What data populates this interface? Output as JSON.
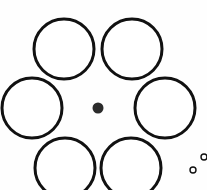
{
  "figure": {
    "name": "Ebbinghaus illusion",
    "alt_name": "Titchener circles",
    "width": 207,
    "height": 190,
    "background_color": "#fefefe",
    "stroke_color": "#111111",
    "fill_color": "#ffffff",
    "dot_color": "#2b2b2b"
  },
  "chart_data": {
    "type": "scatter",
    "title": "",
    "xlabel": "",
    "ylabel": "",
    "xlim": [
      0,
      207
    ],
    "ylim": [
      0,
      190
    ],
    "grid": false,
    "legend": "none",
    "annotations": [],
    "series": [
      {
        "name": "surrounding-circles",
        "role": "inducers",
        "count": 6,
        "arrangement": "hexagonal-ring",
        "ring_center": [
          98,
          106
        ],
        "ring_radius": 66,
        "radius": 30,
        "stroke_width": 3,
        "filled": false,
        "points": [
          {
            "id": "circle-top-left",
            "cx": 64,
            "cy": 49,
            "r": 30
          },
          {
            "id": "circle-top-right",
            "cx": 132,
            "cy": 49,
            "r": 30
          },
          {
            "id": "circle-left",
            "cx": 32,
            "cy": 108,
            "r": 30
          },
          {
            "id": "circle-right",
            "cx": 165,
            "cy": 108,
            "r": 30
          },
          {
            "id": "circle-bottom-left",
            "cx": 65,
            "cy": 168,
            "r": 30
          },
          {
            "id": "circle-bottom-right",
            "cx": 131,
            "cy": 168,
            "r": 30
          }
        ]
      },
      {
        "name": "center-dot",
        "role": "target",
        "count": 1,
        "radius": 5.5,
        "filled": true,
        "points": [
          {
            "id": "center-dot",
            "cx": 98,
            "cy": 108,
            "r": 5.5
          }
        ]
      },
      {
        "name": "small-circles",
        "role": "comparison-markers",
        "count": 2,
        "radius": 3,
        "stroke_width": 1.4,
        "filled": false,
        "points": [
          {
            "id": "small-circle-upper",
            "cx": 204,
            "cy": 157,
            "r": 3
          },
          {
            "id": "small-circle-lower",
            "cx": 193,
            "cy": 170,
            "r": 3
          }
        ]
      }
    ]
  }
}
